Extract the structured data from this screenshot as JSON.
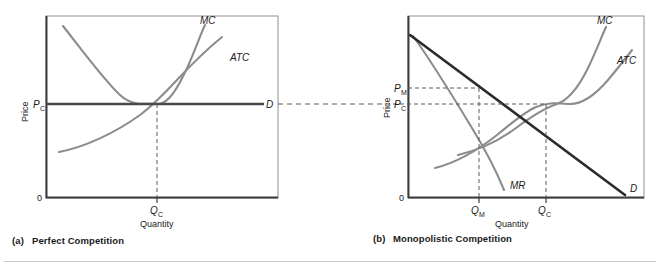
{
  "figure": {
    "panels": [
      {
        "id": "perfect-competition",
        "caption": "(a)  Perfect Competition",
        "caption_index": "(a)",
        "caption_title": "Perfect Competition",
        "y_axis_label": "Price",
        "x_axis_label": "Quantity",
        "origin_label": "0",
        "price_ticks": [
          {
            "id": "pc",
            "base": "P",
            "sub": "C"
          }
        ],
        "quantity_ticks": [
          {
            "id": "qc",
            "base": "Q",
            "sub": "C"
          }
        ],
        "curves": [
          {
            "id": "mc",
            "label": "MC",
            "color": "#8c8c8c"
          },
          {
            "id": "atc",
            "label": "ATC",
            "color": "#8c8c8c"
          },
          {
            "id": "demand",
            "label": "D",
            "color": "#4a4a4a"
          }
        ]
      },
      {
        "id": "monopolistic-competition",
        "caption": "(b)  Monopolistic Competition",
        "caption_index": "(b)",
        "caption_title": "Monopolistic Competition",
        "y_axis_label": "Price",
        "x_axis_label": "Quantity",
        "origin_label": "0",
        "price_ticks": [
          {
            "id": "pm",
            "base": "P",
            "sub": "M"
          },
          {
            "id": "pc",
            "base": "P",
            "sub": "C"
          }
        ],
        "quantity_ticks": [
          {
            "id": "qm",
            "base": "Q",
            "sub": "M"
          },
          {
            "id": "qc",
            "base": "Q",
            "sub": "C"
          }
        ],
        "curves": [
          {
            "id": "mc",
            "label": "MC",
            "color": "#8c8c8c"
          },
          {
            "id": "atc",
            "label": "ATC",
            "color": "#8c8c8c"
          },
          {
            "id": "mr",
            "label": "MR",
            "color": "#8c8c8c"
          },
          {
            "id": "demand",
            "label": "D",
            "color": "#1a1a1a"
          }
        ]
      }
    ],
    "connector": {
      "id": "price-connector",
      "style": "dashed"
    },
    "colors": {
      "frame": "#7a7a7a",
      "axis": "#3d3d3d",
      "gray_curve": "#8c8c8c",
      "dark_curve": "#2b2b2b",
      "demand_flat": "#4a4a4a",
      "dashed": "#5a5a5a",
      "text": "#1a1a1a",
      "divider": "#c8c8c8",
      "background": "#ffffff"
    }
  }
}
